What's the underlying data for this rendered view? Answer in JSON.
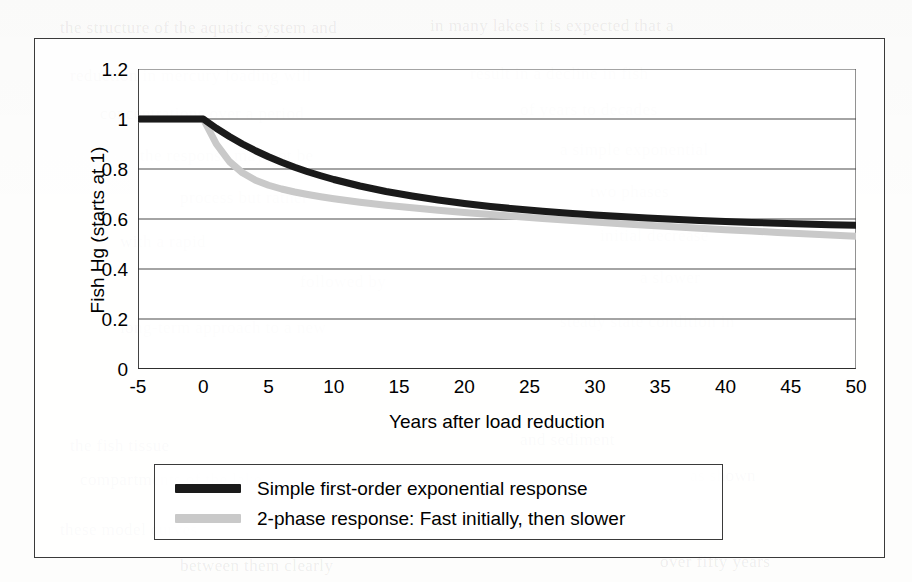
{
  "figure": {
    "plot_background": "#ffffff",
    "frame_color": "#3a3a3a"
  },
  "axes": {
    "x_title": "Years after load reduction",
    "y_title": "Fish Hg (starts at 1)",
    "x_ticks": [
      "-5",
      "0",
      "5",
      "10",
      "15",
      "20",
      "25",
      "30",
      "35",
      "40",
      "45",
      "50"
    ],
    "y_ticks": [
      "1.2",
      "1",
      "0.8",
      "0.6",
      "0.4",
      "0.2",
      "0"
    ]
  },
  "legend": {
    "items": [
      {
        "label": "Simple first-order exponential response",
        "color": "#1a1a1a"
      },
      {
        "label": "2-phase response: Fast initially, then slower",
        "color": "#c9c9c9"
      }
    ]
  },
  "chart_data": {
    "type": "line",
    "title": "",
    "xlabel": "Years after load reduction",
    "ylabel": "Fish Hg (starts at 1)",
    "xlim": [
      -5,
      50
    ],
    "ylim": [
      0,
      1.2
    ],
    "xticks": [
      -5,
      0,
      5,
      10,
      15,
      20,
      25,
      30,
      35,
      40,
      45,
      50
    ],
    "yticks": [
      0,
      0.2,
      0.4,
      0.6,
      0.8,
      1.0,
      1.2
    ],
    "grid": "horizontal",
    "legend_position": "below-axes",
    "x": [
      -5,
      -4,
      -3,
      -2,
      -1,
      0,
      1,
      2,
      3,
      4,
      5,
      6,
      7,
      8,
      9,
      10,
      12,
      14,
      16,
      18,
      20,
      22,
      24,
      26,
      28,
      30,
      32,
      34,
      36,
      38,
      40,
      42,
      44,
      46,
      48,
      50
    ],
    "series": [
      {
        "name": "Simple first-order exponential response",
        "color": "#1a1a1a",
        "line_width_px": 7,
        "values": [
          1.0,
          1.0,
          1.0,
          1.0,
          1.0,
          1.0,
          0.963,
          0.93,
          0.9,
          0.873,
          0.849,
          0.827,
          0.807,
          0.789,
          0.773,
          0.758,
          0.732,
          0.71,
          0.692,
          0.676,
          0.662,
          0.65,
          0.64,
          0.631,
          0.623,
          0.616,
          0.61,
          0.604,
          0.599,
          0.594,
          0.59,
          0.586,
          0.583,
          0.58,
          0.577,
          0.575
        ]
      },
      {
        "name": "2-phase response: Fast initially, then slower",
        "color": "#c9c9c9",
        "line_width_px": 7,
        "values": [
          1.0,
          1.0,
          1.0,
          1.0,
          1.0,
          1.0,
          0.9,
          0.83,
          0.785,
          0.755,
          0.735,
          0.72,
          0.708,
          0.698,
          0.689,
          0.681,
          0.667,
          0.655,
          0.645,
          0.635,
          0.626,
          0.618,
          0.61,
          0.602,
          0.595,
          0.588,
          0.581,
          0.575,
          0.569,
          0.563,
          0.557,
          0.552,
          0.546,
          0.541,
          0.536,
          0.531
        ]
      }
    ]
  },
  "ghost_text": [
    {
      "text": "the structure of the aquatic system and",
      "x": 60,
      "y": 18
    },
    {
      "text": "in many lakes it is expected that a",
      "x": 430,
      "y": 16
    },
    {
      "text": "reduction in mercury loading will",
      "x": 70,
      "y": 66
    },
    {
      "text": "result in a decline in fish",
      "x": 470,
      "y": 64
    },
    {
      "text": "concentrations over a period",
      "x": 100,
      "y": 104
    },
    {
      "text": "of years to decades",
      "x": 520,
      "y": 100
    },
    {
      "text": "the response may not be",
      "x": 140,
      "y": 146
    },
    {
      "text": "a simple exponential",
      "x": 560,
      "y": 140
    },
    {
      "text": "process but rather",
      "x": 180,
      "y": 188
    },
    {
      "text": "two phases",
      "x": 590,
      "y": 182
    },
    {
      "text": "with a rapid",
      "x": 120,
      "y": 232
    },
    {
      "text": "initial decrease",
      "x": 600,
      "y": 226
    },
    {
      "text": "followed by",
      "x": 300,
      "y": 272
    },
    {
      "text": "a slower",
      "x": 640,
      "y": 268
    },
    {
      "text": "long-term approach to a new",
      "x": 120,
      "y": 318
    },
    {
      "text": "steady state condition in",
      "x": 560,
      "y": 312
    },
    {
      "text": "the fish tissue",
      "x": 70,
      "y": 436
    },
    {
      "text": "and sediment",
      "x": 520,
      "y": 430
    },
    {
      "text": "compartments of the lake",
      "x": 80,
      "y": 470
    },
    {
      "text": "as shown",
      "x": 690,
      "y": 466
    },
    {
      "text": "these model curves",
      "x": 60,
      "y": 520
    },
    {
      "text": "illustrate the difference",
      "x": 400,
      "y": 516
    },
    {
      "text": "between them clearly",
      "x": 180,
      "y": 556
    },
    {
      "text": "over fifty years",
      "x": 660,
      "y": 552
    }
  ]
}
